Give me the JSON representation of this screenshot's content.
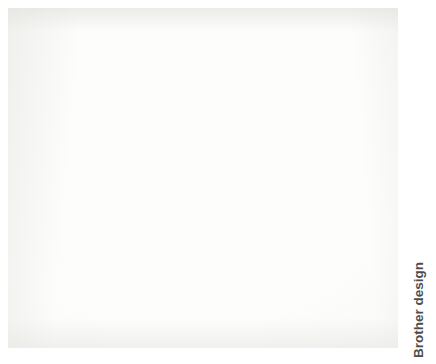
{
  "page": {
    "background_color": "#ffffff",
    "width": 436,
    "height": 364
  },
  "photo": {
    "name": "quilting-design-photograph",
    "alt_description": "Photograph of a printed quilting stitch pattern: a square medallion block with a crosshatched central circle surrounded by swirling teardrop feather petals",
    "paper_color": "#f7f7f5",
    "ink_color": "#4a4a4a",
    "bounds": {
      "x": 8,
      "y": 8,
      "width": 390,
      "height": 340
    }
  },
  "design": {
    "title": "Pinwheel feather medallion quilting pattern",
    "center": {
      "cx": 196,
      "cy": 175,
      "radius": 80
    },
    "crosshatch": {
      "label": "diagonal lattice fill",
      "spacing": 27,
      "angle_degrees": 45
    },
    "petals": {
      "label": "teardrop feather petals",
      "arms": 4,
      "petals_per_arm": 5,
      "total": 20,
      "rotation_degrees": 90
    },
    "arm_petals": [
      {
        "angle": 158,
        "len": 92,
        "w": 46,
        "tip": 20
      },
      {
        "angle": 130,
        "len": 96,
        "w": 47,
        "tip": 20
      },
      {
        "angle": 105,
        "len": 96,
        "w": 46,
        "tip": 20
      },
      {
        "angle": 80,
        "len": 95,
        "w": 45,
        "tip": 19
      },
      {
        "angle": 56,
        "len": 100,
        "w": 50,
        "tip": 21
      }
    ]
  },
  "caption": {
    "text": "Brother design",
    "color": "#4d4d4d",
    "orientation": "vertical-bottom-to-top"
  }
}
